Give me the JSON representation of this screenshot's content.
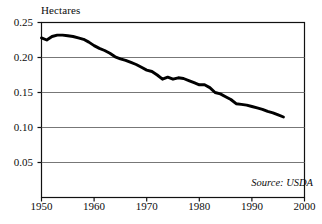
{
  "chart_data": {
    "type": "line",
    "title": "",
    "subtitle": "",
    "xlabel": "",
    "ylabel": "Hectares",
    "xlim": [
      1950,
      2000
    ],
    "ylim": [
      0,
      0.25
    ],
    "grid": "horizontal",
    "legend": "none",
    "source_note": "Source: USDA",
    "x_ticks": [
      "1950",
      "1960",
      "1970",
      "1980",
      "1990",
      "2000"
    ],
    "x_tick_values": [
      1950,
      1960,
      1970,
      1980,
      1990,
      2000
    ],
    "y_ticks": [
      "0.05",
      "0.10",
      "0.15",
      "0.20",
      "0.25"
    ],
    "y_tick_values": [
      0.05,
      0.1,
      0.15,
      0.2,
      0.25
    ],
    "series": [
      {
        "name": "Grain harvested area per person",
        "color": "#000000",
        "x": [
          1950,
          1951,
          1952,
          1953,
          1954,
          1955,
          1956,
          1957,
          1958,
          1959,
          1960,
          1961,
          1962,
          1963,
          1964,
          1965,
          1966,
          1967,
          1968,
          1969,
          1970,
          1971,
          1972,
          1973,
          1974,
          1975,
          1976,
          1977,
          1978,
          1979,
          1980,
          1981,
          1982,
          1983,
          1984,
          1985,
          1986,
          1987,
          1988,
          1989,
          1990,
          1991,
          1992,
          1993,
          1994,
          1995,
          1996
        ],
        "values": [
          0.228,
          0.225,
          0.23,
          0.232,
          0.232,
          0.231,
          0.23,
          0.228,
          0.226,
          0.222,
          0.217,
          0.213,
          0.21,
          0.206,
          0.201,
          0.198,
          0.196,
          0.193,
          0.19,
          0.186,
          0.182,
          0.18,
          0.175,
          0.169,
          0.172,
          0.169,
          0.171,
          0.17,
          0.167,
          0.164,
          0.161,
          0.161,
          0.157,
          0.15,
          0.148,
          0.144,
          0.14,
          0.134,
          0.133,
          0.132,
          0.13,
          0.128,
          0.126,
          0.123,
          0.121,
          0.118,
          0.115
        ]
      }
    ]
  },
  "axes": {
    "y_axis_title": "Hectares",
    "source_note": "Source: USDA"
  }
}
